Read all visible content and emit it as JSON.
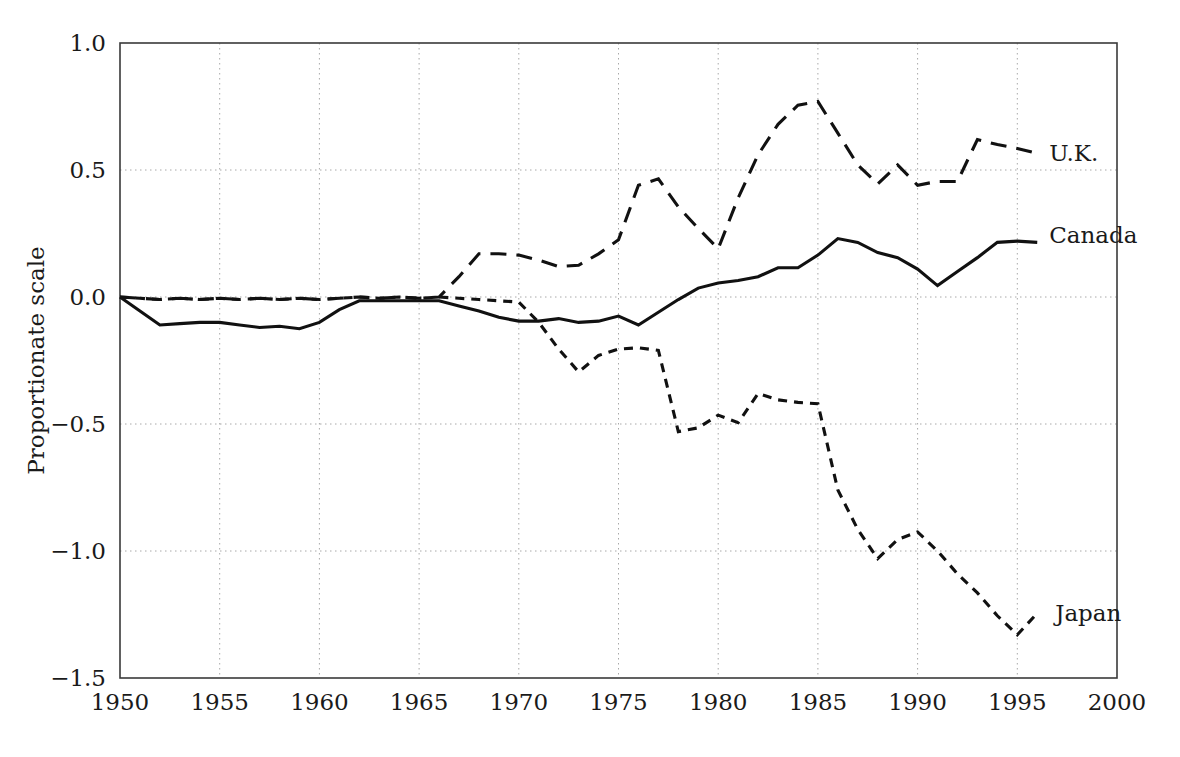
{
  "chart_data": {
    "type": "line",
    "title": "",
    "xlabel": "",
    "ylabel": "Proportionate scale",
    "xlim": [
      1950,
      2000
    ],
    "ylim": [
      -1.5,
      1.0
    ],
    "grid": true,
    "legend_position": "inline-right-of-line-end",
    "xticks": [
      "1950",
      "1955",
      "1960",
      "1965",
      "1970",
      "1975",
      "1980",
      "1985",
      "1990",
      "1995",
      "2000"
    ],
    "xtick_values": [
      1950,
      1955,
      1960,
      1965,
      1970,
      1975,
      1980,
      1985,
      1990,
      1995,
      2000
    ],
    "yticks": [
      "1.0",
      "0.5",
      "0.0",
      "−0.5",
      "−1.0",
      "−1.5"
    ],
    "ytick_values": [
      1.0,
      0.5,
      0.0,
      -0.5,
      -1.0,
      -1.5
    ],
    "series": [
      {
        "name": "U.K.",
        "style": "long-dashed",
        "color": "#111111",
        "label_x": 1996.6,
        "label_y": 0.565,
        "x": [
          1950,
          1951,
          1952,
          1953,
          1954,
          1955,
          1956,
          1957,
          1958,
          1959,
          1960,
          1961,
          1962,
          1963,
          1964,
          1965,
          1966,
          1967,
          1968,
          1969,
          1970,
          1971,
          1972,
          1973,
          1974,
          1975,
          1976,
          1977,
          1978,
          1979,
          1980,
          1981,
          1982,
          1983,
          1984,
          1985,
          1986,
          1987,
          1988,
          1989,
          1990,
          1991,
          1992,
          1993,
          1994,
          1995,
          1996
        ],
        "values": [
          0.0,
          -0.005,
          -0.01,
          -0.005,
          -0.01,
          -0.005,
          -0.01,
          -0.005,
          -0.01,
          -0.005,
          -0.01,
          -0.005,
          0.0,
          -0.005,
          0.0,
          -0.005,
          0.0,
          0.08,
          0.17,
          0.17,
          0.165,
          0.145,
          0.12,
          0.125,
          0.17,
          0.225,
          0.44,
          0.465,
          0.355,
          0.27,
          0.19,
          0.39,
          0.56,
          0.68,
          0.755,
          0.77,
          0.645,
          0.52,
          0.445,
          0.52,
          0.44,
          0.455,
          0.455,
          0.62,
          0.6,
          0.585,
          0.565
        ]
      },
      {
        "name": "Canada",
        "style": "solid",
        "color": "#111111",
        "label_x": 1996.6,
        "label_y": 0.245,
        "x": [
          1950,
          1951,
          1952,
          1953,
          1954,
          1955,
          1956,
          1957,
          1958,
          1959,
          1960,
          1961,
          1962,
          1963,
          1964,
          1965,
          1966,
          1967,
          1968,
          1969,
          1970,
          1971,
          1972,
          1973,
          1974,
          1975,
          1976,
          1977,
          1978,
          1979,
          1980,
          1981,
          1982,
          1983,
          1984,
          1985,
          1986,
          1987,
          1988,
          1989,
          1990,
          1991,
          1992,
          1993,
          1994,
          1995,
          1996
        ],
        "values": [
          0.0,
          -0.055,
          -0.11,
          -0.105,
          -0.1,
          -0.1,
          -0.11,
          -0.12,
          -0.115,
          -0.125,
          -0.1,
          -0.05,
          -0.015,
          -0.015,
          -0.015,
          -0.015,
          -0.015,
          -0.035,
          -0.055,
          -0.08,
          -0.095,
          -0.095,
          -0.085,
          -0.1,
          -0.095,
          -0.075,
          -0.11,
          -0.06,
          -0.01,
          0.035,
          0.055,
          0.065,
          0.08,
          0.115,
          0.115,
          0.165,
          0.23,
          0.215,
          0.175,
          0.155,
          0.11,
          0.045,
          0.1,
          0.155,
          0.215,
          0.22,
          0.215
        ]
      },
      {
        "name": "Japan",
        "style": "short-dashed",
        "color": "#111111",
        "label_x": 1996.9,
        "label_y": -1.245,
        "x": [
          1950,
          1951,
          1952,
          1953,
          1954,
          1955,
          1956,
          1957,
          1958,
          1959,
          1960,
          1961,
          1962,
          1963,
          1964,
          1965,
          1966,
          1967,
          1968,
          1969,
          1970,
          1971,
          1972,
          1973,
          1974,
          1975,
          1976,
          1977,
          1978,
          1979,
          1980,
          1981,
          1982,
          1983,
          1984,
          1985,
          1986,
          1987,
          1988,
          1989,
          1990,
          1991,
          1992,
          1993,
          1994,
          1995,
          1996
        ],
        "values": [
          0.0,
          -0.005,
          -0.01,
          -0.005,
          -0.01,
          -0.005,
          -0.01,
          -0.005,
          -0.01,
          -0.005,
          -0.01,
          -0.005,
          0.0,
          -0.005,
          0.0,
          -0.005,
          0.0,
          -0.005,
          -0.01,
          -0.015,
          -0.02,
          -0.1,
          -0.205,
          -0.295,
          -0.23,
          -0.205,
          -0.2,
          -0.21,
          -0.53,
          -0.515,
          -0.465,
          -0.495,
          -0.38,
          -0.405,
          -0.415,
          -0.42,
          -0.76,
          -0.915,
          -1.03,
          -0.955,
          -0.925,
          -1.0,
          -1.09,
          -1.165,
          -1.255,
          -1.33,
          -1.245
        ]
      }
    ]
  },
  "axes": {
    "y_title": "Proportionate scale"
  }
}
